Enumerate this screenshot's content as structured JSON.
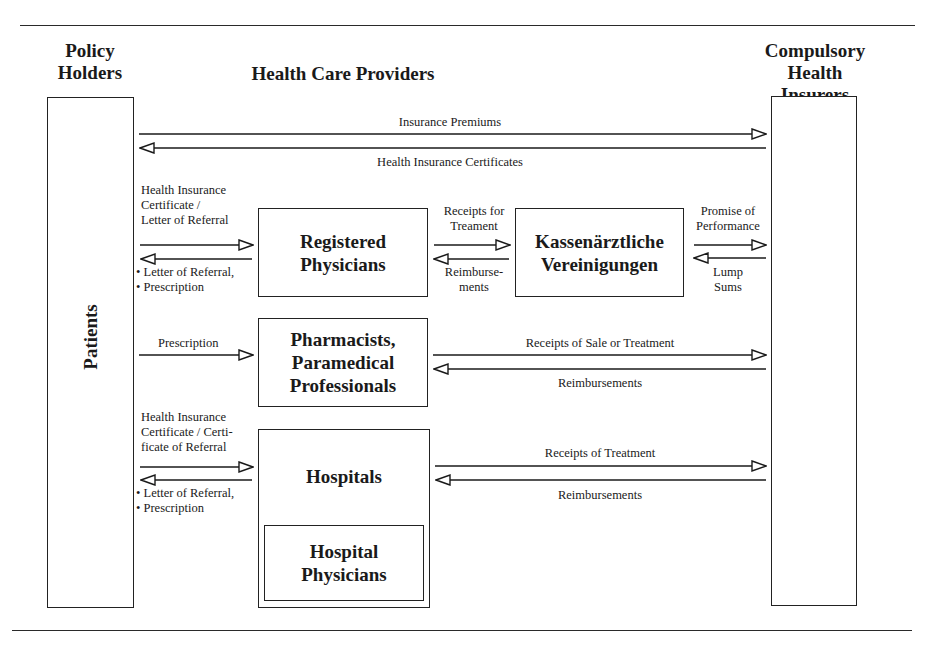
{
  "diagram": {
    "type": "flow-diagram",
    "column_headers": {
      "left": [
        "Policy",
        "Holders"
      ],
      "center": "Health Care Providers",
      "right": [
        "Compulsory",
        "Health Insurers"
      ]
    },
    "nodes": {
      "patients": "Patients",
      "insurers": "",
      "registered_physicians": [
        "Registered",
        "Physicians"
      ],
      "kv": [
        "Kassenärztliche",
        "Vereinigungen"
      ],
      "pharmacists": [
        "Pharmacists,",
        "Paramedical",
        "Professionals"
      ],
      "hospitals": "Hospitals",
      "hospital_physicians": [
        "Hospital",
        "Physicians"
      ]
    },
    "flows": {
      "premiums": "Insurance Premiums",
      "certificates": "Health Insurance Certificates",
      "patient_to_physician": [
        "Health Insurance",
        "Certificate /",
        "Letter of Referral"
      ],
      "physician_to_patient": [
        "• Letter of Referral,",
        "• Prescription"
      ],
      "physician_to_kv": [
        "Receipts for",
        "Treament"
      ],
      "kv_to_physician": [
        "Reimburse-",
        "ments"
      ],
      "kv_to_insurer": [
        "Promise of",
        "Performance"
      ],
      "insurer_to_kv": [
        "Lump",
        "Sums"
      ],
      "patient_to_pharmacist": "Prescription",
      "pharmacist_to_insurer": "Receipts of Sale or Treatment",
      "insurer_to_pharmacist": "Reimbursements",
      "patient_to_hospital": [
        "Health Insurance",
        "Certificate / Certi-",
        "ficate of Referral"
      ],
      "hospital_to_patient": [
        "• Letter of Referral,",
        "• Prescription"
      ],
      "hospital_to_insurer": "Receipts of Treatment",
      "insurer_to_hospital": "Reimbursements"
    },
    "colors": {
      "ink": "#1a1a1a",
      "background": "#ffffff"
    }
  }
}
